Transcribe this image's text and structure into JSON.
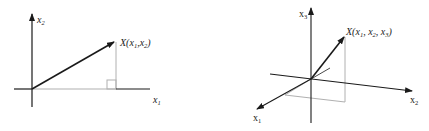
{
  "figure_2d": {
    "axis_x_label": "x",
    "axis_x_sub": "1",
    "axis_y_label": "x",
    "axis_y_sub": "2",
    "point_label_prefix": "X(x",
    "point_sub_1": "1",
    "point_sep": ",x",
    "point_sub_2": "2",
    "point_suffix": ")"
  },
  "figure_3d": {
    "axis_1_label": "x",
    "axis_1_sub": "1",
    "axis_2_label": "x",
    "axis_2_sub": "2",
    "axis_3_label": "x",
    "axis_3_sub": "3",
    "point_label_prefix": "X(x",
    "point_sub_1": "1",
    "point_sep_1": ", x",
    "point_sub_2": "2",
    "point_sep_2": ", x",
    "point_sub_3": "3",
    "point_suffix": ")"
  },
  "colors": {
    "axis": "#1a1a1a",
    "projection": "#b0b0b0"
  }
}
